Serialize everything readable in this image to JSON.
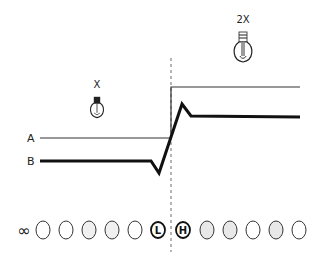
{
  "diagram": {
    "lines": [
      {
        "label": "A",
        "style": "thin",
        "points": [
          [
            40,
            138
          ],
          [
            171,
            138
          ],
          [
            171,
            87
          ],
          [
            300,
            87
          ]
        ]
      },
      {
        "label": "B",
        "style": "thick",
        "points": [
          [
            40,
            161
          ],
          [
            151,
            161
          ],
          [
            159,
            173
          ],
          [
            182,
            104
          ],
          [
            191,
            116
          ],
          [
            300,
            117
          ]
        ]
      }
    ],
    "bulbs": [
      {
        "caption": "X",
        "icon": "lightbulb-icon",
        "x": 97,
        "y": 108,
        "scale": 0.8
      },
      {
        "caption": "2X",
        "icon": "lightbulb-icon",
        "x": 243,
        "y": 48,
        "scale": 1.0
      }
    ],
    "divider": {
      "x": 171,
      "y1": 58,
      "y2": 252
    },
    "row": {
      "infinity_symbol": "∞",
      "circles": [
        {
          "kind": "plain"
        },
        {
          "kind": "plain"
        },
        {
          "kind": "plain"
        },
        {
          "kind": "plain"
        },
        {
          "kind": "plain"
        },
        {
          "kind": "letter",
          "text": "L"
        },
        {
          "kind": "letter",
          "text": "H"
        },
        {
          "kind": "shaded"
        },
        {
          "kind": "shaded"
        },
        {
          "kind": "plain"
        },
        {
          "kind": "shaded"
        },
        {
          "kind": "plain"
        }
      ]
    }
  }
}
